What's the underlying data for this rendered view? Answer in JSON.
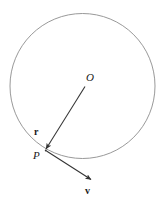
{
  "figure": {
    "background_color": "#ffffff",
    "stroke_color": "#3a3a3a",
    "circle_stroke_color": "#8a8a8a",
    "labels": {
      "center_point": "O",
      "circle_point": "P",
      "radius_vector": "r",
      "velocity_vector": "v"
    },
    "geometry": {
      "circle": {
        "cx": 82.5,
        "cy": 86,
        "r": 72.5
      },
      "radius_arrow": {
        "x1": 85,
        "y1": 86,
        "x2": 45.5,
        "y2": 149.5
      },
      "velocity_arrow": {
        "x1": 46.5,
        "y1": 151,
        "x2": 92,
        "y2": 180.5
      }
    }
  }
}
